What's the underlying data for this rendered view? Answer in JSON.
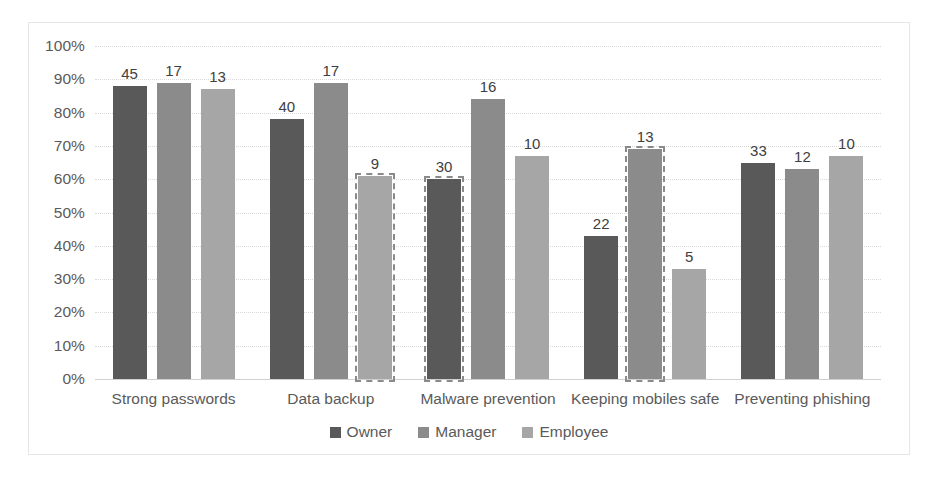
{
  "chart_data": {
    "type": "bar",
    "title": "",
    "xlabel": "",
    "ylabel": "",
    "ylim": [
      0,
      100
    ],
    "ytick_labels": [
      "100%",
      "90%",
      "80%",
      "70%",
      "60%",
      "50%",
      "40%",
      "30%",
      "20%",
      "10%",
      "0%"
    ],
    "ytick_values": [
      100,
      90,
      80,
      70,
      60,
      50,
      40,
      30,
      20,
      10,
      0
    ],
    "grid": true,
    "legend_position": "bottom",
    "categories": [
      "Strong passwords",
      "Data backup",
      "Malware prevention",
      "Keeping mobiles safe",
      "Preventing phishing"
    ],
    "series": [
      {
        "name": "Owner",
        "color": "#595959",
        "values": [
          88,
          78,
          60,
          43,
          65
        ],
        "data_labels": [
          "45",
          "40",
          "30",
          "22",
          "33"
        ],
        "selected": [
          false,
          false,
          true,
          false,
          false
        ]
      },
      {
        "name": "Manager",
        "color": "#8b8b8b",
        "values": [
          89,
          89,
          84,
          69,
          63
        ],
        "data_labels": [
          "17",
          "17",
          "16",
          "13",
          "12"
        ],
        "selected": [
          false,
          false,
          false,
          true,
          false
        ]
      },
      {
        "name": "Employee",
        "color": "#a6a6a6",
        "values": [
          87,
          61,
          67,
          33,
          67
        ],
        "data_labels": [
          "13",
          "9",
          "10",
          "5",
          "10"
        ],
        "selected": [
          false,
          true,
          false,
          false,
          false
        ]
      }
    ]
  },
  "legend": {
    "items": [
      {
        "label": "Owner"
      },
      {
        "label": "Manager"
      },
      {
        "label": "Employee"
      }
    ]
  }
}
